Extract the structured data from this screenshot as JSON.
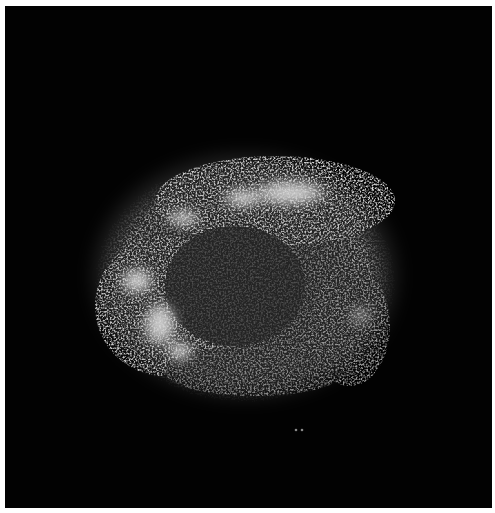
{
  "image": {
    "subject": "supernova remnant X-ray image",
    "description": "Grainy grayscale shell-shaped nebula with bright knots along the top arc and lower-left lobe, on a black background",
    "background_color": "#020202",
    "border_color": "#ffffff",
    "features": [
      {
        "name": "top-bright-arc",
        "cx": 280,
        "cy": 186
      },
      {
        "name": "upper-left-knot",
        "cx": 180,
        "cy": 212
      },
      {
        "name": "left-lobe",
        "cx": 155,
        "cy": 300
      },
      {
        "name": "lower-left-knot",
        "cx": 160,
        "cy": 330
      },
      {
        "name": "right-rim",
        "cx": 355,
        "cy": 310
      },
      {
        "name": "faint-point-sources",
        "cx": 300,
        "cy": 430
      }
    ]
  }
}
